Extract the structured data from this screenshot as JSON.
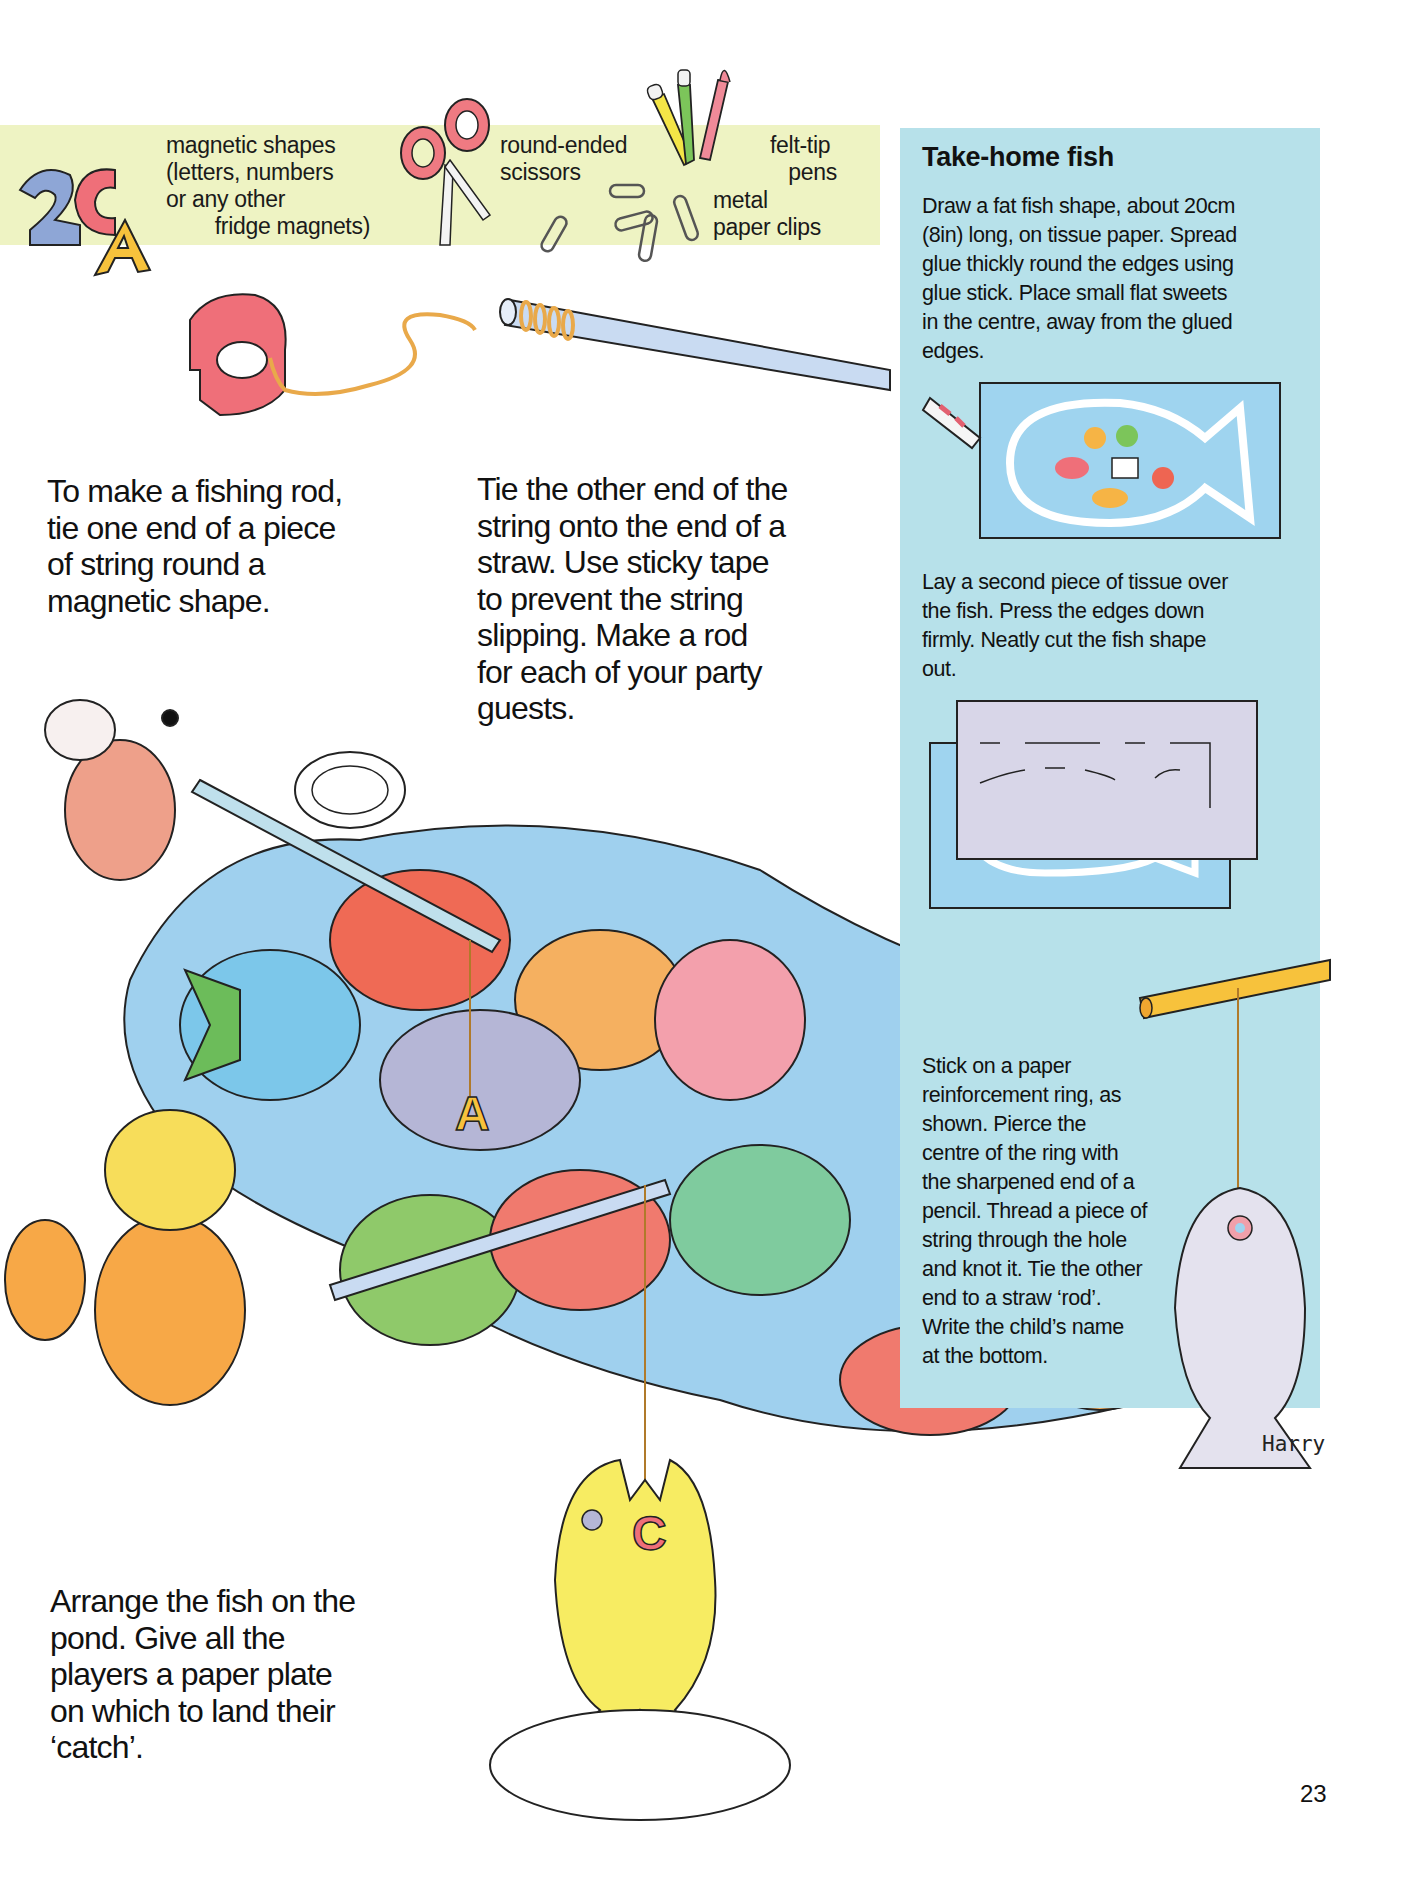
{
  "materials": {
    "magnets_label": "magnetic shapes\n(letters, numbers\nor any other\n        fridge magnets)",
    "scissors_label": "round-ended\nscissors",
    "pens_label": "felt-tip\n   pens",
    "clips_label": "metal\npaper clips"
  },
  "steps": {
    "step1": "To make a fishing rod,\ntie one end of a piece\nof string round a\nmagnetic shape.",
    "step2": "Tie the other end of the\nstring onto the end of a\nstraw. Use sticky tape\nto prevent the string\nslipping. Make a rod\nfor each of your party\nguests.",
    "step3": "Arrange the fish on the\npond. Give all the\nplayers a paper plate\non which to land their\n‘catch’."
  },
  "panel": {
    "title": "Take-home fish",
    "para1": "Draw a fat fish shape, about 20cm\n(8in) long, on tissue paper. Spread\nglue thickly round the edges using\nglue stick. Place small flat sweets\nin the centre, away from the glued\nedges.",
    "para2": "Lay a second piece of tissue over\nthe fish. Press the edges down\nfirmly. Neatly cut the fish shape\nout.",
    "para3": "Stick on a paper\nreinforcement ring, as\nshown. Pierce the\ncentre of the ring with\nthe sharpened end of a\npencil. Thread a piece of\nstring through the hole\nand knot it. Tie the other\nend to a straw ‘rod’.\nWrite the child’s name\nat the bottom.",
    "name_tag": "Harry"
  },
  "illustrations": {
    "magnet_letters": [
      "2",
      "C",
      "A"
    ],
    "hooked_letter": "A",
    "caught_letter": "C"
  },
  "colors": {
    "strip_yellow": "#eef3c3",
    "panel_blue": "#b7e1ea",
    "pond_blue": "#9fd0ee",
    "magnet_red": "#ee6f78",
    "straw_blue": "#a9c4e6",
    "string_orange": "#e9a94a"
  },
  "page_number": "23"
}
